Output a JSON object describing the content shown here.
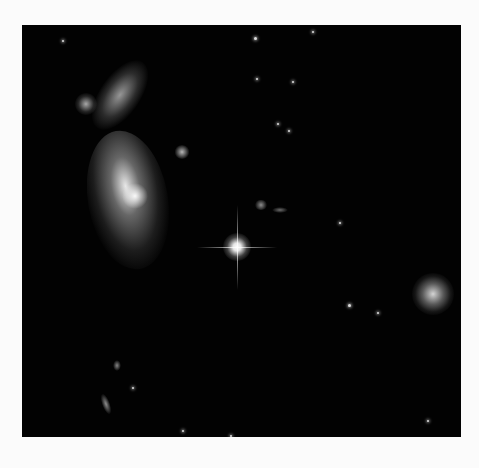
{
  "image": {
    "alt": "Deep-space image of an interacting galaxy group: a large irregular galaxy with a tidal tail on the left, a bright foreground star with diffraction spikes at center, a small spiral galaxy on the right, and scattered faint stars and galaxies.",
    "background_color": "#020202",
    "page_color": "#fbfbfb"
  },
  "features": [
    {
      "name": "tidal-tail",
      "x": 118,
      "y": 70
    },
    {
      "name": "main-galaxy",
      "x": 130,
      "y": 200
    },
    {
      "name": "small-galaxy-top-left",
      "x": 85,
      "y": 105
    },
    {
      "name": "bright-star",
      "x": 237,
      "y": 247
    },
    {
      "name": "spiral-galaxy-right",
      "x": 432,
      "y": 293
    }
  ]
}
